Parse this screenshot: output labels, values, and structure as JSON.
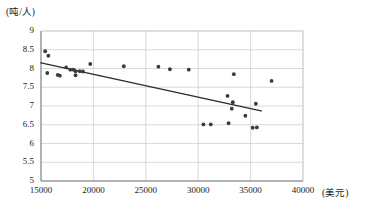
{
  "chart_data": {
    "type": "scatter",
    "title": "",
    "xlabel": "(美元)",
    "ylabel": "(吨/人)",
    "xlim": [
      15000,
      40000
    ],
    "ylim": [
      5,
      9
    ],
    "grid": true,
    "legend": false,
    "x_ticks": [
      15000,
      20000,
      25000,
      30000,
      35000,
      40000
    ],
    "x_tick_labels": [
      "15000",
      "20000",
      "25000",
      "30000",
      "35000",
      "40000"
    ],
    "y_ticks": [
      5,
      5.5,
      6,
      6.5,
      7,
      7.5,
      8,
      8.5,
      9
    ],
    "y_tick_labels": [
      "5",
      "5.5",
      "6",
      "6.5",
      "7",
      "7.5",
      "8",
      "8.5",
      "9"
    ],
    "series": [
      {
        "name": "人均能源消费量",
        "marker": "circle",
        "color": "#3a3a3a",
        "points": [
          {
            "x": 15400,
            "y": 8.46
          },
          {
            "x": 15700,
            "y": 8.34
          },
          {
            "x": 15600,
            "y": 7.88
          },
          {
            "x": 16600,
            "y": 7.83
          },
          {
            "x": 16800,
            "y": 7.81
          },
          {
            "x": 17400,
            "y": 8.03
          },
          {
            "x": 17800,
            "y": 7.97
          },
          {
            "x": 18100,
            "y": 7.97
          },
          {
            "x": 18300,
            "y": 7.93
          },
          {
            "x": 18300,
            "y": 7.82
          },
          {
            "x": 18700,
            "y": 7.93
          },
          {
            "x": 19000,
            "y": 7.92
          },
          {
            "x": 19700,
            "y": 8.12
          },
          {
            "x": 22900,
            "y": 8.06
          },
          {
            "x": 26200,
            "y": 8.05
          },
          {
            "x": 27300,
            "y": 7.98
          },
          {
            "x": 29100,
            "y": 7.97
          },
          {
            "x": 30500,
            "y": 6.51
          },
          {
            "x": 31200,
            "y": 6.51
          },
          {
            "x": 32800,
            "y": 7.27
          },
          {
            "x": 32900,
            "y": 6.54
          },
          {
            "x": 33200,
            "y": 6.93
          },
          {
            "x": 33300,
            "y": 7.1
          },
          {
            "x": 33400,
            "y": 7.85
          },
          {
            "x": 34500,
            "y": 6.74
          },
          {
            "x": 35200,
            "y": 6.42
          },
          {
            "x": 35500,
            "y": 7.06
          },
          {
            "x": 35600,
            "y": 6.43
          },
          {
            "x": 37000,
            "y": 7.67
          }
        ]
      }
    ],
    "trendline": {
      "name": "线性趋势线",
      "color": "#2b2b2b",
      "x_start": 15000,
      "y_start": 8.15,
      "x_end": 36000,
      "y_end": 6.87
    }
  }
}
